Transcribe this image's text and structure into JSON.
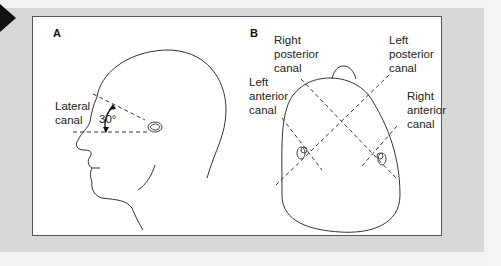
{
  "figure": {
    "panels": [
      {
        "letter": "A",
        "view": "lateral head profile",
        "labels": {
          "lateral_canal": "Lateral\ncanal",
          "angle": "30°"
        }
      },
      {
        "letter": "B",
        "view": "top of head",
        "labels": {
          "right_posterior": "Right\nposterior\ncanal",
          "left_posterior": "Left\nposterior\ncanal",
          "left_anterior": "Left\nanterior\ncanal",
          "right_anterior": "Right\nanterior\ncanal"
        }
      }
    ],
    "colors": {
      "frame_border": "#555555",
      "line": "#333333",
      "background": "#d8d8d8"
    }
  }
}
